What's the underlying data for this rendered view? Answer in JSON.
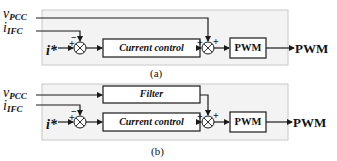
{
  "panels": [
    {
      "id": "a",
      "caption": "(a)",
      "inputs": {
        "v_pcc": {
          "main": "v",
          "sub": "PCC"
        },
        "i_ifc": {
          "main": "i",
          "sub": "IFC"
        },
        "i_ref": {
          "main": "i*"
        }
      },
      "sum1_signs": {
        "top": "−",
        "left": "+"
      },
      "blocks": {
        "current_control": "Current control",
        "pwm": "PWM"
      },
      "sum2_signs": {
        "left": "+",
        "right": "+"
      },
      "output": "PWM"
    },
    {
      "id": "b",
      "caption": "(b)",
      "inputs": {
        "v_pcc": {
          "main": "v",
          "sub": "PCC"
        },
        "i_ifc": {
          "main": "i",
          "sub": "IFC"
        },
        "i_ref": {
          "main": "i*"
        }
      },
      "sum1_signs": {
        "top": "−",
        "left": "+"
      },
      "blocks": {
        "filter": "Filter",
        "current_control": "Current control",
        "pwm": "PWM"
      },
      "sum2_signs": {
        "left": "+",
        "right": "+"
      },
      "output": "PWM"
    }
  ],
  "colors": {
    "panel_fill": "#f3f3f3",
    "panel_border": "#c8c8c8",
    "line": "#1a1a1a"
  }
}
